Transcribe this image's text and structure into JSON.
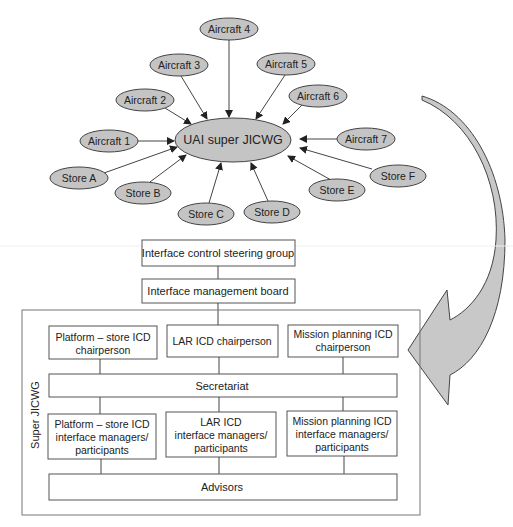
{
  "hub": {
    "label": "UAI super JICWG",
    "cx": 233,
    "cy": 140,
    "rx": 58,
    "ry": 22
  },
  "nodes": [
    {
      "label": "Aircraft 4",
      "cx": 229,
      "cy": 29,
      "rx": 29,
      "ry": 11
    },
    {
      "label": "Aircraft 3",
      "cx": 179,
      "cy": 65,
      "rx": 29,
      "ry": 11
    },
    {
      "label": "Aircraft 5",
      "cx": 286,
      "cy": 64,
      "rx": 29,
      "ry": 11
    },
    {
      "label": "Aircraft 2",
      "cx": 145,
      "cy": 100,
      "rx": 29,
      "ry": 11
    },
    {
      "label": "Aircraft 6",
      "cx": 318,
      "cy": 96,
      "rx": 29,
      "ry": 11
    },
    {
      "label": "Aircraft 1",
      "cx": 109,
      "cy": 141,
      "rx": 29,
      "ry": 11
    },
    {
      "label": "Aircraft 7",
      "cx": 366,
      "cy": 139,
      "rx": 29,
      "ry": 11
    },
    {
      "label": "Store A",
      "cx": 79,
      "cy": 178,
      "rx": 29,
      "ry": 11
    },
    {
      "label": "Store B",
      "cx": 143,
      "cy": 193,
      "rx": 28,
      "ry": 11
    },
    {
      "label": "Store C",
      "cx": 206,
      "cy": 214,
      "rx": 28,
      "ry": 11
    },
    {
      "label": "Store D",
      "cx": 272,
      "cy": 212,
      "rx": 28,
      "ry": 11
    },
    {
      "label": "Store E",
      "cx": 337,
      "cy": 190,
      "rx": 28,
      "ry": 11
    },
    {
      "label": "Store F",
      "cx": 398,
      "cy": 176,
      "rx": 28,
      "ry": 11
    }
  ],
  "hierarchy": {
    "steering": "Interface control steering group",
    "board": "Interface management board",
    "container_label": "Super JICWG",
    "chairs": [
      {
        "lines": [
          "Platform – store ICD",
          "chairperson"
        ]
      },
      {
        "lines": [
          "LAR ICD chairperson"
        ]
      },
      {
        "lines": [
          "Mission planning ICD",
          "chairperson"
        ]
      }
    ],
    "secretariat": "Secretariat",
    "managers": [
      {
        "lines": [
          "Platform – store ICD",
          "interface managers/",
          "participants"
        ]
      },
      {
        "lines": [
          "LAR ICD",
          "interface managers/",
          "participants"
        ]
      },
      {
        "lines": [
          "Mission planning ICD",
          "interface managers/",
          "participants"
        ]
      }
    ],
    "advisors": "Advisors"
  },
  "colors": {
    "node_fill": "#c4c4c4",
    "arrow_fill": "#c8c8c8",
    "stroke": "#444444"
  }
}
